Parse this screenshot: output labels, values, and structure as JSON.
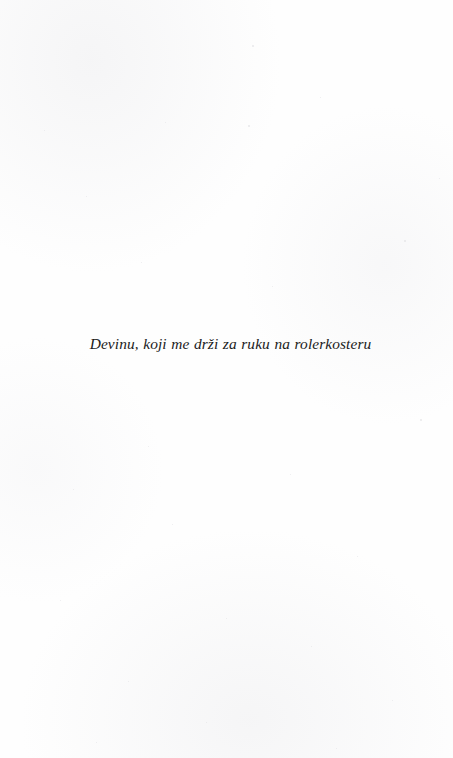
{
  "page": {
    "kind": "book-dedication-page",
    "background_color": "#fefefe",
    "ink_color": "#1b1b1b",
    "page_number": "",
    "running_header": "",
    "running_footer": ""
  },
  "dedication": {
    "text": "Devinu, koji me drži za ruku na rolerkosteru",
    "style": "italic",
    "alignment": "center"
  },
  "speckles": [
    {
      "x": 252,
      "y": 45,
      "d": 1.6
    },
    {
      "x": 320,
      "y": 97,
      "d": 1.3
    },
    {
      "x": 44,
      "y": 130,
      "d": 1.4
    },
    {
      "x": 165,
      "y": 122,
      "d": 1.2
    },
    {
      "x": 248,
      "y": 125,
      "d": 1.5
    },
    {
      "x": 439,
      "y": 178,
      "d": 1.3
    },
    {
      "x": 86,
      "y": 196,
      "d": 1.2
    },
    {
      "x": 404,
      "y": 240,
      "d": 1.6
    },
    {
      "x": 141,
      "y": 262,
      "d": 1.2
    },
    {
      "x": 272,
      "y": 286,
      "d": 1.3
    },
    {
      "x": 420,
      "y": 419,
      "d": 1.5
    },
    {
      "x": 148,
      "y": 446,
      "d": 1.2
    },
    {
      "x": 73,
      "y": 489,
      "d": 1.3
    },
    {
      "x": 290,
      "y": 474,
      "d": 1.2
    },
    {
      "x": 172,
      "y": 524,
      "d": 1.4
    },
    {
      "x": 357,
      "y": 556,
      "d": 1.2
    },
    {
      "x": 60,
      "y": 600,
      "d": 1.3
    },
    {
      "x": 226,
      "y": 618,
      "d": 1.2
    },
    {
      "x": 311,
      "y": 646,
      "d": 1.4
    },
    {
      "x": 128,
      "y": 681,
      "d": 1.2
    },
    {
      "x": 392,
      "y": 700,
      "d": 1.3
    },
    {
      "x": 206,
      "y": 722,
      "d": 1.2
    },
    {
      "x": 96,
      "y": 742,
      "d": 1.4
    },
    {
      "x": 336,
      "y": 748,
      "d": 1.3
    }
  ]
}
